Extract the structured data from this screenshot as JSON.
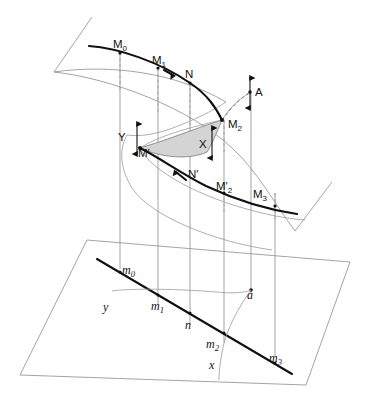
{
  "figure": {
    "background": "#ffffff",
    "shaded_region_color": "#d4d4d4",
    "line_color": "#111111",
    "thin_line_color": "#8d8d8d"
  },
  "upper_surface": {
    "name": "equilibrium-surface",
    "fold_curve_label": "fold",
    "points": [
      {
        "id": "M0",
        "label": "M",
        "sub": "0",
        "x": 120,
        "y": 52
      },
      {
        "id": "M1",
        "label": "M",
        "sub": "1",
        "x": 158,
        "y": 68
      },
      {
        "id": "N",
        "label": "N",
        "sub": "",
        "x": 190,
        "y": 82
      },
      {
        "id": "M2",
        "label": "M",
        "sub": "2",
        "x": 222,
        "y": 120
      },
      {
        "id": "A",
        "label": "A",
        "sub": "",
        "x": 250,
        "y": 92
      },
      {
        "id": "X",
        "label": "X",
        "sub": "",
        "x": 205,
        "y": 143
      },
      {
        "id": "Y",
        "label": "Y",
        "sub": "",
        "x": 127,
        "y": 133
      },
      {
        "id": "Mp",
        "label": "M′",
        "sub": "",
        "x": 140,
        "y": 148
      },
      {
        "id": "Np",
        "label": "N′",
        "sub": "",
        "x": 190,
        "y": 172
      },
      {
        "id": "Mp2",
        "label": "M′",
        "sub": "2",
        "x": 224,
        "y": 186
      },
      {
        "id": "M3",
        "label": "M",
        "sub": "3",
        "x": 251,
        "y": 193
      }
    ]
  },
  "base_plane": {
    "name": "control-plane",
    "points": [
      {
        "id": "m0",
        "label": "m",
        "sub": "0",
        "x": 120,
        "y": 269
      },
      {
        "id": "y",
        "label": "y",
        "sub": "",
        "x": 108,
        "y": 306
      },
      {
        "id": "m1",
        "label": "m",
        "sub": "1",
        "x": 158,
        "y": 305
      },
      {
        "id": "n",
        "label": "n",
        "sub": "",
        "x": 190,
        "y": 325
      },
      {
        "id": "a",
        "label": "a",
        "sub": "",
        "x": 251,
        "y": 294
      },
      {
        "id": "m2",
        "label": "m",
        "sub": "2",
        "x": 224,
        "y": 343
      },
      {
        "id": "x",
        "label": "x",
        "sub": "",
        "x": 213,
        "y": 363
      },
      {
        "id": "m3",
        "label": "m",
        "sub": "3",
        "x": 275,
        "y": 357
      }
    ]
  },
  "projection_lines": [
    {
      "from": "M0",
      "to": "m0",
      "x": 120,
      "style": "solid"
    },
    {
      "from": "M1",
      "to": "m1",
      "x": 158,
      "style": "solid"
    },
    {
      "from": "N",
      "to": "n",
      "x": 190,
      "style": "solid"
    },
    {
      "from": "M2",
      "to": "m2",
      "x": 224,
      "style": "solid"
    },
    {
      "from": "A",
      "to": "a",
      "x": 251,
      "style": "solid"
    },
    {
      "from": "M3",
      "to": "m3",
      "x": 275,
      "style": "solid"
    }
  ],
  "arrows": {
    "A_vertical": "double-headed",
    "X_vertical": "double-headed",
    "Y_vertical": "double-headed",
    "upper_branch_direction": "rightward",
    "lower_branch_direction": "leftward"
  }
}
